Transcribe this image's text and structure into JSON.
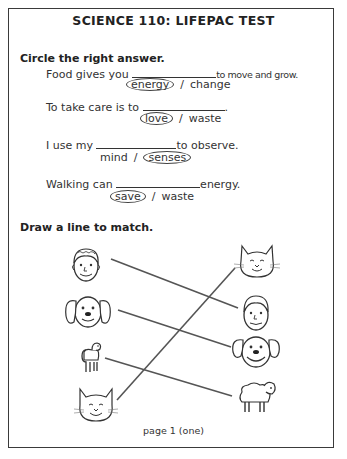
{
  "title": "SCIENCE 110: LIFEPAC TEST",
  "section1": {
    "heading": "Circle the right answer.",
    "questions": [
      {
        "before": "Food gives you",
        "after": "to move and grow.",
        "options": [
          "energy",
          "change"
        ],
        "circled": 0
      },
      {
        "before": "To take care is to",
        "after": ".",
        "options": [
          "love",
          "waste"
        ],
        "circled": 0
      },
      {
        "before": "I use my",
        "after": "to observe.",
        "options": [
          "mind",
          "senses"
        ],
        "circled": 1
      },
      {
        "before": "Walking can",
        "after": "energy.",
        "options": [
          "save",
          "waste"
        ],
        "circled": 0
      }
    ],
    "separator": "/"
  },
  "section2": {
    "heading": "Draw a line to match.",
    "left_items": [
      "man-face-icon",
      "dog-face-icon",
      "lamb-icon",
      "cat-face-icon"
    ],
    "right_items": [
      "cat-face-icon",
      "man-face-icon",
      "dog-face-icon",
      "sheep-icon"
    ],
    "matches": [
      {
        "left": "man",
        "right": "man"
      },
      {
        "left": "dog",
        "right": "dog"
      },
      {
        "left": "lamb",
        "right": "sheep"
      },
      {
        "left": "cat",
        "right": "cat"
      }
    ]
  },
  "footer": "page 1 (one)"
}
